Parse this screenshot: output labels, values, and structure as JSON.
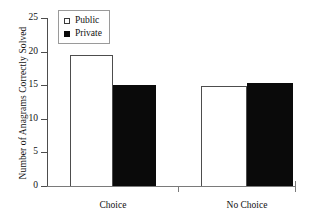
{
  "chart_data": {
    "type": "bar",
    "title": "",
    "xlabel": "",
    "ylabel": "Number of Anagrams Correctly Solved",
    "categories": [
      "Choice",
      "No Choice"
    ],
    "series": [
      {
        "name": "Public",
        "values": [
          19.5,
          14.9
        ],
        "color": "#ffffff",
        "marker": "open-square"
      },
      {
        "name": "Private",
        "values": [
          15.0,
          15.4
        ],
        "color": "#0a0a0a",
        "marker": "filled-square"
      }
    ],
    "ylim": [
      0,
      25
    ],
    "yticks": [
      0,
      5,
      10,
      15,
      20,
      25
    ],
    "ytick_labels": [
      "0",
      "5",
      "10",
      "15",
      "20",
      "25"
    ],
    "grid": false,
    "legend_position": "top-left"
  },
  "legend": {
    "entries": [
      {
        "label": "Public"
      },
      {
        "label": "Private"
      }
    ]
  }
}
